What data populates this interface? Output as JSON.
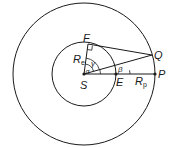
{
  "diagram": {
    "type": "geometry",
    "points": {
      "S": {
        "label": "S"
      },
      "F": {
        "label": "F"
      },
      "Q": {
        "label": "Q"
      },
      "P": {
        "label": "P"
      },
      "E": {
        "label": "E"
      }
    },
    "lengths": {
      "Re": {
        "label": "R",
        "sub": "e"
      },
      "Rp": {
        "label": "R",
        "sub": "p"
      }
    },
    "angles": {
      "alpha": "α",
      "beta": "β",
      "gamma": "γ"
    },
    "colors": {
      "stroke": "#1a1a1a",
      "background": "#ffffff"
    }
  }
}
